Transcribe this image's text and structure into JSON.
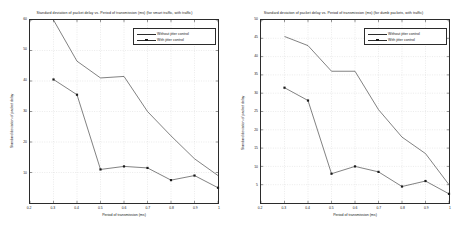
{
  "chart_data": [
    {
      "type": "line",
      "title": "Standard deviation of packet delay vs. Period of transmission (ms) (for smart traffic, with traffic)",
      "xlabel": "Period of transmission (ms)",
      "ylabel": "Standard deviation of packet delay",
      "x": [
        0.3,
        0.4,
        0.5,
        0.6,
        0.7,
        0.8,
        0.9,
        1.0
      ],
      "xlim": [
        0.2,
        1.0
      ],
      "ylim": [
        0,
        60
      ],
      "xticks": [
        "0.2",
        "0.3",
        "0.4",
        "0.5",
        "0.6",
        "0.7",
        "0.8",
        "0.9",
        "1"
      ],
      "yticks": [
        "10",
        "20",
        "30",
        "40",
        "50",
        "60"
      ],
      "grid": true,
      "legend_position": "top-right",
      "series": [
        {
          "name": "Without jitter control",
          "marker": "none",
          "values": [
            60.0,
            46.5,
            41.0,
            41.5,
            30.0,
            22.0,
            14.5,
            9.0
          ]
        },
        {
          "name": "With jitter control",
          "marker": "square",
          "values": [
            40.5,
            35.5,
            11.0,
            12.0,
            11.5,
            7.5,
            9.0,
            5.0
          ]
        }
      ]
    },
    {
      "type": "line",
      "title": "Standard deviation of packet delay vs. Period of transmission (ms) (for dumb packets, with traffic)",
      "xlabel": "Period of transmission (ms)",
      "ylabel": "Standard deviation of packet delay",
      "x": [
        0.3,
        0.4,
        0.5,
        0.6,
        0.7,
        0.8,
        0.9,
        1.0
      ],
      "xlim": [
        0.2,
        1.0
      ],
      "ylim": [
        0,
        50
      ],
      "xticks": [
        "0.2",
        "0.3",
        "0.4",
        "0.5",
        "0.6",
        "0.7",
        "0.8",
        "0.9",
        "1"
      ],
      "yticks": [
        "5",
        "10",
        "15",
        "20",
        "25",
        "30",
        "35",
        "40",
        "45",
        "50"
      ],
      "grid": true,
      "legend_position": "top-right",
      "series": [
        {
          "name": "Without jitter control",
          "marker": "none",
          "values": [
            45.5,
            43.0,
            36.0,
            36.0,
            25.5,
            18.0,
            13.5,
            5.0
          ]
        },
        {
          "name": "With jitter control",
          "marker": "square",
          "values": [
            31.5,
            28.0,
            8.0,
            10.0,
            8.5,
            4.5,
            6.0,
            2.5
          ]
        }
      ]
    }
  ],
  "colors": {
    "axis": "#2b2b2b",
    "line": "#2b2b2b",
    "marker": "#1a1a1a",
    "grid": "#cccccc",
    "background": "#ffffff"
  }
}
